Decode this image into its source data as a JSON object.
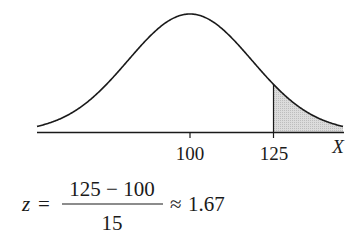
{
  "figure": {
    "type": "normal-distribution-diagram",
    "mean": 100,
    "sd": 15,
    "shaded_region": "X >= 125",
    "shade_color": "#d4d4d4",
    "line_color": "#1a1a1a"
  },
  "axis": {
    "label": "X",
    "ticks": [
      {
        "value": "100"
      },
      {
        "value": "125"
      }
    ]
  },
  "formula": {
    "lhs": "z",
    "equals": "=",
    "numerator": "125 − 100",
    "denominator": "15",
    "approx": "≈",
    "result": "1.67"
  }
}
